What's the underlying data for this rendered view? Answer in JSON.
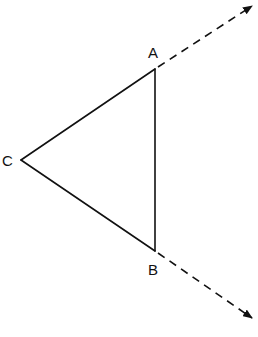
{
  "diagram": {
    "type": "geometry",
    "stroke_color": "#111111",
    "background": "#ffffff",
    "vertices": {
      "A": {
        "label": "A",
        "x": 155,
        "y": 69,
        "label_x": 148,
        "label_y": 58
      },
      "B": {
        "label": "B",
        "x": 155,
        "y": 251,
        "label_x": 148,
        "label_y": 275
      },
      "C": {
        "label": "C",
        "x": 21,
        "y": 160,
        "label_x": 2,
        "label_y": 166
      }
    },
    "segments": [
      {
        "from": "C",
        "to": "A",
        "style": "solid"
      },
      {
        "from": "A",
        "to": "B",
        "style": "solid"
      },
      {
        "from": "C",
        "to": "B",
        "style": "solid"
      }
    ],
    "rays": [
      {
        "from": "A",
        "direction": "extension of CA",
        "style": "dashed",
        "end_x": 253,
        "end_y": 5,
        "arrow": true
      },
      {
        "from": "B",
        "direction": "extension of CB",
        "style": "dashed",
        "end_x": 253,
        "end_y": 319,
        "arrow": true
      }
    ]
  }
}
